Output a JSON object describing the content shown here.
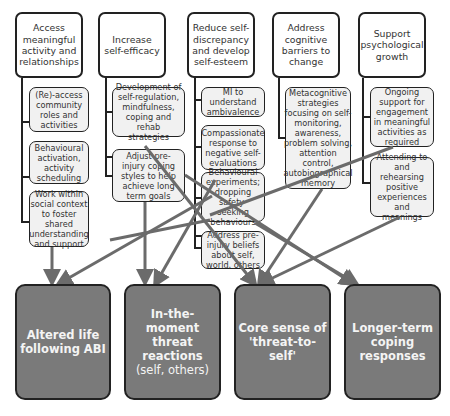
{
  "goals": [
    {
      "label": "Access meaningful activity and relationships"
    },
    {
      "label": "Increase self-efficacy"
    },
    {
      "label": "Reduce self-discrepancy and develop self-esteem"
    },
    {
      "label": "Address cognitive barriers to change"
    },
    {
      "label": "Support psychological growth"
    }
  ],
  "strategies": {
    "access": [
      {
        "label": "(Re)-access community roles and activities"
      },
      {
        "label": "Behavioural activation, activity scheduling"
      },
      {
        "label": "Work within social context to foster shared understanding and support"
      }
    ],
    "efficacy": [
      {
        "label": "Development of self-regulation, mindfulness, coping and rehab strategies"
      },
      {
        "label": "Adjust pre-injury coping styles to help achieve long term goals"
      }
    ],
    "esteem": [
      {
        "label": "MI to understand ambivalence"
      },
      {
        "label": "Compassionate response to negative self-evaluations"
      },
      {
        "label": "Behavioural experiments; dropping safety-seeking behaviours"
      },
      {
        "label": "Address pre-injury beliefs about self, world, others"
      }
    ],
    "cognitive": [
      {
        "label": "Metacognitive strategies focusing on self-monitoring, awareness, problem solving, attention control, autobiographical memory"
      }
    ],
    "growth": [
      {
        "label": "Ongoing support for engagement in meaningful activities as required"
      },
      {
        "label": "Attending to and rehearsing positive experiences and meanings"
      }
    ]
  },
  "outcomes": [
    {
      "label": "Altered life following ABI",
      "sub": ""
    },
    {
      "label": "In-the-moment threat reactions",
      "sub": "(self, others)"
    },
    {
      "label": "Core sense of 'threat-to-self'",
      "sub": ""
    },
    {
      "label": "Longer-term coping responses",
      "sub": ""
    }
  ],
  "colors": {
    "outcome_fill": "#7a7a7a",
    "arrow": "#6b6b6b",
    "border": "#222222"
  }
}
